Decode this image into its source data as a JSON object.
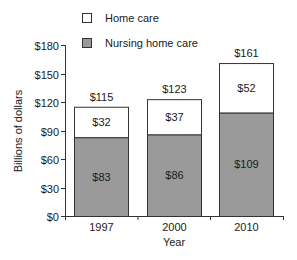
{
  "chart_data": {
    "type": "bar",
    "stacked": true,
    "title": "",
    "xlabel": "Year",
    "ylabel": "Billions of dollars",
    "categories": [
      "1997",
      "2000",
      "2010"
    ],
    "series": [
      {
        "name": "Nursing home care",
        "values": [
          83,
          86,
          109
        ],
        "labels": [
          "$83",
          "$86",
          "$109"
        ],
        "color": "#9a9a9a"
      },
      {
        "name": "Home care",
        "values": [
          32,
          37,
          52
        ],
        "labels": [
          "$32",
          "$37",
          "$52"
        ],
        "color": "#ffffff"
      }
    ],
    "totals": [
      115,
      123,
      161
    ],
    "total_labels": [
      "$115",
      "$123",
      "$161"
    ],
    "ylim": [
      0,
      180
    ],
    "yticks": [
      0,
      30,
      60,
      90,
      120,
      150,
      180
    ],
    "ytick_labels": [
      "$0",
      "$30",
      "$60",
      "$90",
      "$120",
      "$150",
      "$180"
    ],
    "grid": false,
    "legend_position": "top",
    "legend": [
      {
        "label": "Home care",
        "color": "#ffffff"
      },
      {
        "label": "Nursing home care",
        "color": "#9a9a9a"
      }
    ]
  }
}
